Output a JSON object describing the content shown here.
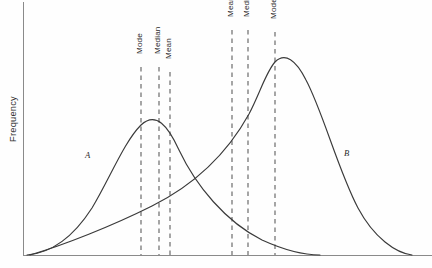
{
  "chart_data": {
    "type": "line",
    "title": "",
    "subtitle": "",
    "xlabel": "",
    "ylabel": "Frequency",
    "grid": false,
    "legend_position": "inline-annotation",
    "xlim": [
      0,
      432
    ],
    "ylim": [
      0,
      268
    ],
    "x_axis_ticks": [],
    "y_axis_ticks": [],
    "annotations": [
      "Curve A is positively (right) skewed: Mode < Median < Mean",
      "Curve B is negatively (left) skewed: Mean < Median < Mode"
    ],
    "series": [
      {
        "name": "A",
        "label": "A",
        "skew": "positive",
        "label_x": 85,
        "label_y": 150,
        "peak_x": 141,
        "peak_y": 125,
        "baseline_start_x": 27,
        "baseline_end_x": 320,
        "markers": [
          {
            "name": "Mode",
            "x": 141,
            "label_top_y": 55
          },
          {
            "name": "Median",
            "x": 159,
            "label_top_y": 55
          },
          {
            "name": "Mean",
            "x": 170,
            "label_top_y": 60
          }
        ]
      },
      {
        "name": "B",
        "label": "B",
        "skew": "negative",
        "label_x": 344,
        "label_y": 148,
        "peak_x": 275,
        "peak_y": 62,
        "baseline_start_x": 30,
        "baseline_end_x": 412,
        "markers": [
          {
            "name": "Mean",
            "x": 232,
            "label_top_y": 18
          },
          {
            "name": "Median",
            "x": 248,
            "label_top_y": 18
          },
          {
            "name": "Mode",
            "x": 275,
            "label_top_y": 20
          }
        ]
      }
    ],
    "colors": {
      "background": "#fefefe",
      "curve": "#3a3a3a",
      "axis": "#8a8a8a",
      "dashed_marker": "#5d5d5d",
      "text": "#2b2b2b"
    },
    "geometry": {
      "axis_x": 23,
      "axis_top_y": 2,
      "baseline_y": 255,
      "axis_right_x": 432,
      "curve_a_path": "M 27 255 C 52 253, 74 236, 92 208 C 110 178, 124 142, 141 125 C 156 111, 168 126, 179 150 C 196 186, 226 222, 262 240 C 284 250, 305 255, 320 255",
      "curve_b_path": "M 30 255 C 64 245, 112 226, 152 206 C 196 184, 228 152, 249 114 C 260 93, 266 72, 275 62 C 285 52, 296 60, 306 80 C 323 112, 338 170, 358 208 C 374 238, 396 253, 412 255"
    }
  },
  "ylabel_text": "Frequency"
}
